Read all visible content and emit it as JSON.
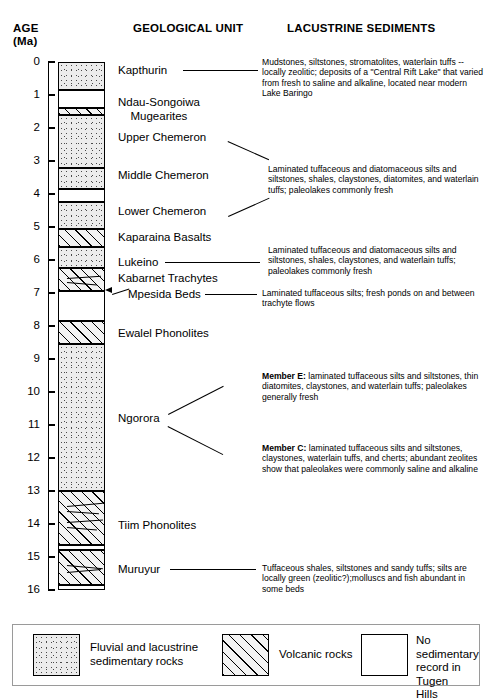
{
  "headers": {
    "age": "AGE",
    "age_unit": "(Ma)",
    "geological_unit": "GEOLOGICAL UNIT",
    "lacustrine_sediments": "LACUSTRINE SEDIMENTS"
  },
  "axis": {
    "label": "AGE (Ma)",
    "min": 0,
    "max": 16,
    "ticks": [
      "0",
      "1",
      "2",
      "3",
      "4",
      "5",
      "6",
      "7",
      "8",
      "9",
      "10",
      "11",
      "12",
      "13",
      "14",
      "15",
      "16"
    ]
  },
  "chart_data": {
    "type": "table",
    "ylabel": "AGE (Ma)",
    "ylim": [
      0,
      16
    ],
    "y_inverted": true,
    "grid": false,
    "bands": [
      {
        "name": "Kapthurin",
        "top": 0.0,
        "bottom": 0.85,
        "rock": "sedimentary"
      },
      {
        "name": "No record 0.85-1.4",
        "top": 0.85,
        "bottom": 1.4,
        "rock": "none"
      },
      {
        "name": "Ndau-Songoiwa Mugearites",
        "top": 1.4,
        "bottom": 1.62,
        "rock": "volcanic"
      },
      {
        "name": "Upper Chemeron",
        "top": 1.62,
        "bottom": 3.2,
        "rock": "sedimentary"
      },
      {
        "name": "Middle Chemeron",
        "top": 3.2,
        "bottom": 3.85,
        "rock": "sedimentary"
      },
      {
        "name": "No record 3.85-4.25",
        "top": 3.85,
        "bottom": 4.25,
        "rock": "none"
      },
      {
        "name": "Lower Chemeron",
        "top": 4.25,
        "bottom": 5.05,
        "rock": "sedimentary"
      },
      {
        "name": "Kaparaina Basalts",
        "top": 5.05,
        "bottom": 5.6,
        "rock": "volcanic"
      },
      {
        "name": "Lukeino",
        "top": 5.6,
        "bottom": 6.25,
        "rock": "sedimentary"
      },
      {
        "name": "Kabarnet Trachytes / Mpesida Beds",
        "top": 6.25,
        "bottom": 6.95,
        "rock": "volcanic"
      },
      {
        "name": "No record 6.95-7.85",
        "top": 6.95,
        "bottom": 7.85,
        "rock": "none"
      },
      {
        "name": "Ewalel Phonolites",
        "top": 7.85,
        "bottom": 8.55,
        "rock": "volcanic"
      },
      {
        "name": "Ngorora",
        "top": 8.55,
        "bottom": 13.0,
        "rock": "sedimentary"
      },
      {
        "name": "Tiim Phonolites",
        "top": 13.0,
        "bottom": 14.65,
        "rock": "volcanic"
      },
      {
        "name": "No record 14.65-14.8",
        "top": 14.65,
        "bottom": 14.8,
        "rock": "none"
      },
      {
        "name": "Muruyur",
        "top": 14.8,
        "bottom": 15.85,
        "rock": "volcanic"
      },
      {
        "name": "No record 15.85-16",
        "top": 15.85,
        "bottom": 16.0,
        "rock": "none"
      }
    ]
  },
  "units": [
    {
      "id": "kapthurin",
      "label": "Kapthurin"
    },
    {
      "id": "ndau",
      "label_line1": "Ndau-Songoiwa",
      "label_line2": "Mugearites"
    },
    {
      "id": "upper-chemeron",
      "label": "Upper Chemeron"
    },
    {
      "id": "middle-chemeron",
      "label": "Middle Chemeron"
    },
    {
      "id": "lower-chemeron",
      "label": "Lower Chemeron"
    },
    {
      "id": "kaparaina",
      "label": "Kaparaina Basalts"
    },
    {
      "id": "lukeino",
      "label": "Lukeino"
    },
    {
      "id": "kabarnet",
      "label": "Kabarnet Trachytes"
    },
    {
      "id": "mpesida",
      "label": "Mpesida Beds"
    },
    {
      "id": "ewalel",
      "label": "Ewalel Phonolites"
    },
    {
      "id": "ngorora",
      "label": "Ngorora"
    },
    {
      "id": "tiim",
      "label": "Tiim Phonolites"
    },
    {
      "id": "muruyur",
      "label": "Muruyur"
    }
  ],
  "descriptions": {
    "kapthurin": "Mudstones, siltstones, stromatolites, waterlain tuffs -- locally zeolitic; deposits of a \"Central Rift Lake\" that varied from fresh to saline and alkaline, located near modern Lake Baringo",
    "chemeron": "Laminated tuffaceous and diatomaceous silts and siltstones, shales, claystones, diatomites, and waterlain tuffs; paleolakes commonly fresh",
    "lukeino": "Laminated tuffaceous and diatomaceous silts and siltstones, shales, claystones, and waterlain tuffs; paleolakes commonly fresh",
    "mpesida": "Laminated tuffaceous silts; fresh ponds on and between trachyte flows",
    "ngorora_e_label": "Member E:",
    "ngorora_e": " laminated tuffaceous silts and siltstones, thin diatomites, claystones, and waterlain tuffs; paleolakes generally fresh",
    "ngorora_c_label": "Member C:",
    "ngorora_c": " laminated tuffaceous silts and siltstones, claystones, waterlain tuffs, and cherts; abundant zeolites show that paleolakes were commonly saline and alkaline",
    "muruyur": "Tuffaceous shales, siltstones and sandy tuffs; silts are locally green (zeolitic?);molluscs and fish abundant in some beds"
  },
  "legend": {
    "items": [
      {
        "pattern": "stipple",
        "line1": "Fluvial and lacustrine",
        "line2": "sedimentary rocks"
      },
      {
        "pattern": "hatch",
        "line1": "Volcanic rocks",
        "line2": ""
      },
      {
        "pattern": "blank",
        "line1": "No sedimentary",
        "line2": "record in Tugen",
        "line3": "Hills"
      }
    ]
  }
}
